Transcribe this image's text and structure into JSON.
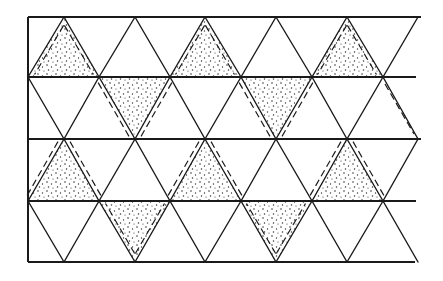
{
  "diagram": {
    "title": "",
    "colors": {
      "line": "#1a1a1a",
      "stipple": "#333333",
      "background": "#ffffff"
    },
    "grid": {
      "row_lines_y": [
        17,
        77,
        139,
        201,
        262
      ],
      "left_x": 28,
      "right_x": 418,
      "tri_width": 71,
      "odd_row_top_apices_x": [
        64,
        135,
        205,
        276,
        347,
        418
      ],
      "even_row_vertices_x": [
        28,
        99,
        170,
        241,
        312,
        383
      ]
    },
    "bands": [
      {
        "row": 1,
        "shaded_orientation": "up",
        "shaded_apex_x": [
          64,
          205,
          347
        ],
        "dash_mode": "inside"
      },
      {
        "row": 2,
        "shaded_orientation": "down",
        "shaded_apex_x": [
          135,
          276
        ],
        "dash_mode": "outside"
      },
      {
        "row": 3,
        "shaded_orientation": "up",
        "shaded_apex_x": [
          64,
          205,
          347
        ],
        "dash_mode": "outside"
      },
      {
        "row": 4,
        "shaded_orientation": "down",
        "shaded_apex_x": [
          135,
          276
        ],
        "dash_mode": "inside"
      }
    ]
  }
}
